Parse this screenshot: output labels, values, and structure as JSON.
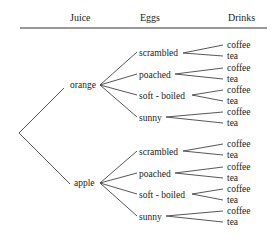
{
  "headers": {
    "juice": "Juice",
    "eggs": "Eggs",
    "drinks": "Drinks"
  },
  "tree": {
    "juice": [
      {
        "label": "orange",
        "eggs": [
          {
            "label": "scrambled",
            "drinks": [
              "coffee",
              "tea"
            ]
          },
          {
            "label": "poached",
            "drinks": [
              "coffee",
              "tea"
            ]
          },
          {
            "label": "soft - boiled",
            "drinks": [
              "coffee",
              "tea"
            ]
          },
          {
            "label": "sunny",
            "drinks": [
              "coffee",
              "tea"
            ]
          }
        ]
      },
      {
        "label": "apple",
        "eggs": [
          {
            "label": "scrambled",
            "drinks": [
              "coffee",
              "tea"
            ]
          },
          {
            "label": "poached",
            "drinks": [
              "coffee",
              "tea"
            ]
          },
          {
            "label": "soft - boiled",
            "drinks": [
              "coffee",
              "tea"
            ]
          },
          {
            "label": "sunny",
            "drinks": [
              "coffee",
              "tea"
            ]
          }
        ]
      }
    ]
  },
  "colors": {
    "line": "#444444",
    "text": "#222222",
    "background": "#ffffff"
  }
}
